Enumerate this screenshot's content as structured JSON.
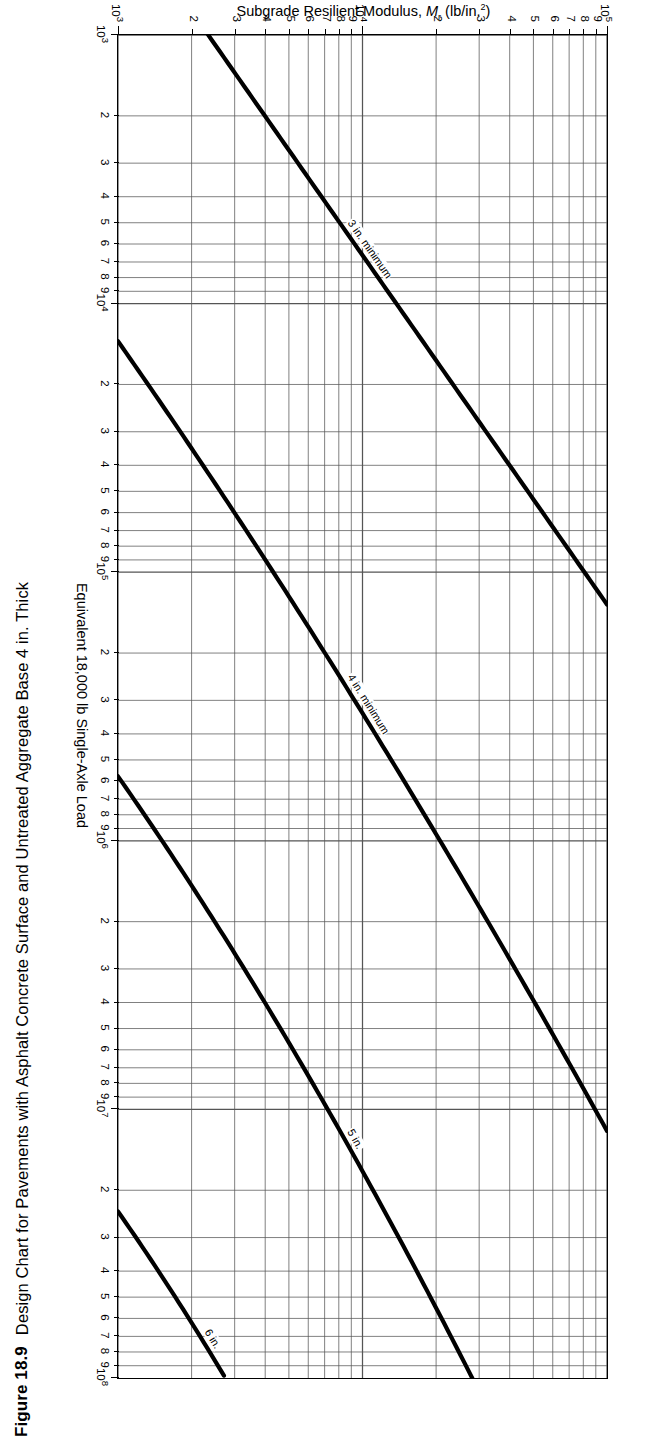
{
  "figure": {
    "number": "Figure 18.9",
    "title": "Design Chart for Pavements with Asphalt Concrete Surface and Untreated Aggregate Base 4 in. Thick"
  },
  "chart_data": {
    "type": "line",
    "title": "Design Chart for Pavements with Asphalt Concrete Surface and Untreated Aggregate Base 4 in. Thick",
    "xlabel": "Equivalent 18,000 lb Single-Axle Load",
    "ylabel": "Subgrade Resilient Modulus, Mr (lb/in.2)",
    "xscale": "log",
    "yscale": "log",
    "xlim": [
      1000,
      100000000
    ],
    "ylim": [
      1000,
      100000
    ],
    "grid": true,
    "legend_position": "inline-curve-labels",
    "x_decade_labels": [
      "103",
      "104",
      "105",
      "106",
      "107",
      "108"
    ],
    "x_minor_labels": [
      "2",
      "3",
      "4",
      "5",
      "6",
      "7",
      "8",
      "9"
    ],
    "y_decade_labels": [
      "103",
      "104",
      "105"
    ],
    "y_minor_labels": [
      "2",
      "3",
      "4",
      "5",
      "6",
      "7",
      "8",
      "9"
    ],
    "curve_label_suffix": "in.",
    "series": [
      {
        "name": "3 in. minimum",
        "thickness_in": 3,
        "label": "3 in. minimum"
      },
      {
        "name": "4 in. minimum",
        "thickness_in": 4,
        "label": "4 in. minimum"
      },
      {
        "name": "5 in.",
        "thickness_in": 5,
        "label": "5 in."
      },
      {
        "name": "6 in.",
        "thickness_in": 6,
        "label": "6 in."
      },
      {
        "name": "7 in.",
        "thickness_in": 7,
        "label": "7 in."
      },
      {
        "name": "8 in.",
        "thickness_in": 8,
        "label": "8 in."
      },
      {
        "name": "9 in.",
        "thickness_in": 9,
        "label": "9 in."
      },
      {
        "name": "10 in.",
        "thickness_in": 10,
        "label": "10 in."
      },
      {
        "name": "11 in.",
        "thickness_in": 11,
        "label": "11 in."
      },
      {
        "name": "12 in.",
        "thickness_in": 12,
        "label": "12 in."
      },
      {
        "name": "13 in.",
        "thickness_in": 13,
        "label": "13 in."
      },
      {
        "name": "14 in.",
        "thickness_in": 14,
        "label": "14 in."
      },
      {
        "name": "15 in.",
        "thickness_in": 15,
        "label": "15 in."
      },
      {
        "name": "16 in.",
        "thickness_in": 16,
        "label": "16 in."
      },
      {
        "name": "17 in.",
        "thickness_in": 17,
        "label": "17 in."
      }
    ],
    "colors": {
      "curve": "#000000",
      "grid": "#555555",
      "frame": "#000000",
      "background": "#ffffff"
    }
  }
}
